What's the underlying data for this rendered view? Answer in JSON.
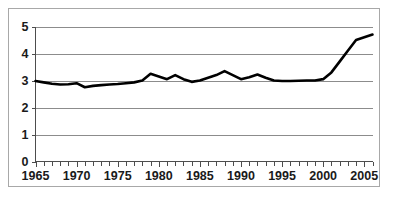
{
  "chart_data": {
    "type": "line",
    "title": "",
    "subtitle": "",
    "xlabel": "",
    "ylabel": "",
    "xlim": [
      1965,
      2006
    ],
    "ylim": [
      0,
      5
    ],
    "grid": true,
    "legend": false,
    "legend_position": "none",
    "line_color": "#000000",
    "gridline_color": "#8c8c8c",
    "axis_color": "#4d4d4d",
    "background_color": "#ffffff",
    "border_color": "#a8a8a8",
    "y_ticks": [
      0,
      1,
      2,
      3,
      4,
      5
    ],
    "y_tick_labels": [
      "0",
      "1",
      "2",
      "3",
      "4",
      "5"
    ],
    "x_ticks": [
      1965,
      1970,
      1975,
      1980,
      1985,
      1990,
      1995,
      2000,
      2005
    ],
    "x_tick_labels": [
      "1965",
      "1970",
      "1975",
      "1980",
      "1985",
      "1990",
      "1995",
      "2000",
      "2005"
    ],
    "x_minor_tick_interval": 1,
    "x": [
      1965,
      1966,
      1967,
      1968,
      1969,
      1970,
      1971,
      1972,
      1973,
      1974,
      1975,
      1976,
      1977,
      1978,
      1979,
      1980,
      1981,
      1982,
      1983,
      1984,
      1985,
      1986,
      1987,
      1988,
      1989,
      1990,
      1991,
      1992,
      1993,
      1994,
      1995,
      1996,
      1997,
      1998,
      1999,
      2000,
      2001,
      2002,
      2003,
      2004,
      2005,
      2006
    ],
    "values": [
      2.98,
      2.93,
      2.88,
      2.85,
      2.86,
      2.9,
      2.75,
      2.8,
      2.83,
      2.85,
      2.87,
      2.9,
      2.93,
      3.0,
      3.25,
      3.15,
      3.05,
      3.2,
      3.05,
      2.95,
      3.0,
      3.1,
      3.2,
      3.35,
      3.2,
      3.05,
      3.12,
      3.22,
      3.1,
      3.0,
      2.98,
      2.98,
      2.99,
      3.0,
      3.0,
      3.05,
      3.3,
      3.7,
      4.1,
      4.5,
      4.6,
      4.7
    ],
    "series": [
      {
        "name": "series-1",
        "values": [
          2.98,
          2.93,
          2.88,
          2.85,
          2.86,
          2.9,
          2.75,
          2.8,
          2.83,
          2.85,
          2.87,
          2.9,
          2.93,
          3.0,
          3.25,
          3.15,
          3.05,
          3.2,
          3.05,
          2.95,
          3.0,
          3.1,
          3.2,
          3.35,
          3.2,
          3.05,
          3.12,
          3.22,
          3.1,
          3.0,
          2.98,
          2.98,
          2.99,
          3.0,
          3.0,
          3.05,
          3.3,
          3.7,
          4.1,
          4.5,
          4.6,
          4.7
        ]
      }
    ]
  }
}
